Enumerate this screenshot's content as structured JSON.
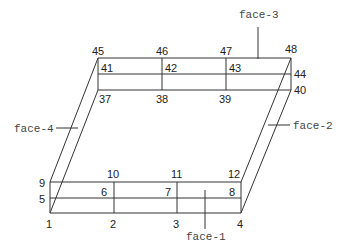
{
  "diagram": {
    "type": "mesh-box",
    "front_face": {
      "corners": {
        "left": 50,
        "right": 241,
        "top": 182,
        "mid": 198,
        "bottom": 213
      },
      "dividers_x": [
        114,
        177
      ]
    },
    "back_face": {
      "corners": {
        "left": 98,
        "right": 291,
        "top": 58,
        "mid": 74,
        "bottom": 90
      },
      "dividers_x": [
        162,
        226
      ]
    },
    "nodes": [
      {
        "id": "1",
        "x": 46,
        "y": 228
      },
      {
        "id": "2",
        "x": 110,
        "y": 228
      },
      {
        "id": "3",
        "x": 173,
        "y": 228
      },
      {
        "id": "4",
        "x": 237,
        "y": 228
      },
      {
        "id": "5",
        "x": 39,
        "y": 203
      },
      {
        "id": "6",
        "x": 101,
        "y": 196
      },
      {
        "id": "7",
        "x": 165,
        "y": 196
      },
      {
        "id": "8",
        "x": 229,
        "y": 196
      },
      {
        "id": "9",
        "x": 39,
        "y": 187
      },
      {
        "id": "10",
        "x": 107,
        "y": 178
      },
      {
        "id": "11",
        "x": 171,
        "y": 178
      },
      {
        "id": "12",
        "x": 228,
        "y": 178
      },
      {
        "id": "37",
        "x": 99,
        "y": 103
      },
      {
        "id": "38",
        "x": 156,
        "y": 103
      },
      {
        "id": "39",
        "x": 219,
        "y": 103
      },
      {
        "id": "40",
        "x": 294,
        "y": 94
      },
      {
        "id": "41",
        "x": 101,
        "y": 72
      },
      {
        "id": "42",
        "x": 165,
        "y": 72
      },
      {
        "id": "43",
        "x": 229,
        "y": 72
      },
      {
        "id": "44",
        "x": 294,
        "y": 78
      },
      {
        "id": "45",
        "x": 92,
        "y": 55
      },
      {
        "id": "46",
        "x": 156,
        "y": 55
      },
      {
        "id": "47",
        "x": 220,
        "y": 55
      },
      {
        "id": "48",
        "x": 285,
        "y": 53
      }
    ],
    "faces": [
      {
        "id": "face-1",
        "label": "face-1",
        "x": 186,
        "y": 240,
        "leader": [
          205,
          190,
          205,
          229
        ]
      },
      {
        "id": "face-2",
        "label": "face-2",
        "x": 293,
        "y": 129,
        "leader": [
          268,
          125,
          290,
          125
        ]
      },
      {
        "id": "face-3",
        "label": "face-3",
        "x": 239,
        "y": 18,
        "leader": [
          258,
          27,
          258,
          59
        ]
      },
      {
        "id": "face-4",
        "label": "face-4",
        "x": 14,
        "y": 132,
        "leader": [
          56,
          128,
          78,
          128
        ]
      }
    ]
  }
}
